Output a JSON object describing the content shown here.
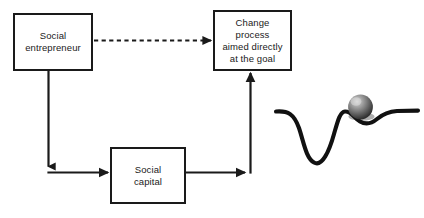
{
  "diagram": {
    "background_color": "#ffffff",
    "stroke_color": "#1a1a1a",
    "nodes": [
      {
        "id": "social-entrepreneur",
        "label": "Social\nentrepreneur",
        "shape": "rectangle"
      },
      {
        "id": "change-process",
        "label": "Change\nprocess\naimed directly\nat the goal",
        "shape": "rectangle"
      },
      {
        "id": "social-capital",
        "label": "Social\ncapital",
        "shape": "rectangle"
      }
    ],
    "connectors": [
      {
        "id": "entrepreneur-to-change-process",
        "from": "social-entrepreneur",
        "to": "change-process",
        "style": "dashed",
        "arrowhead": "end",
        "direction": "right"
      },
      {
        "id": "entrepreneur-to-social-capital",
        "from": "social-entrepreneur",
        "to": "social-capital",
        "style": "solid",
        "arrowhead": "end",
        "direction": "down-then-right"
      },
      {
        "id": "social-capital-to-change-process",
        "from": "social-capital",
        "to": "change-process",
        "style": "solid",
        "arrowhead": "end",
        "direction": "right-then-up"
      }
    ],
    "illustration": {
      "id": "energy-landscape",
      "description": "Wavy curve with a deep well on the left, a peak, and a shallow dip holding a gray sphere, flattening to the right",
      "ball_color": "#6e6e6e",
      "ball_highlight_color": "#c9c9c9",
      "ball_shadow_color": "#2b2b2b",
      "curve_color": "#111111"
    }
  }
}
